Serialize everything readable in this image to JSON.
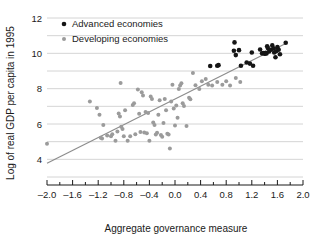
{
  "chart_data": {
    "type": "scatter",
    "title": "",
    "xlabel": "Aggregate governance measure",
    "ylabel": "Log of real GDP per capita in 1995",
    "xlim": [
      -2.0,
      2.0
    ],
    "ylim": [
      3.0,
      12.0
    ],
    "xticks": [
      -2.0,
      -1.6,
      -1.2,
      -0.8,
      -0.4,
      0.0,
      0.4,
      0.8,
      1.2,
      1.6,
      2.0
    ],
    "xtick_labels": [
      "–2.0",
      "–1.6",
      "–1.2",
      "–0.8",
      "–0.4",
      "0.0",
      "0.4",
      "0.8",
      "1.2",
      "1.6",
      "2.0"
    ],
    "xminor_step": 0.2,
    "yticks": [
      4,
      6,
      8,
      10,
      12
    ],
    "ytick_labels": [
      "4",
      "6",
      "8",
      "10",
      "12"
    ],
    "ygridlines": [
      3,
      4,
      5,
      6,
      7,
      8,
      9,
      10,
      11,
      12
    ],
    "grid": true,
    "grid_color": "#c9c9c9",
    "legend_position": "top-left",
    "legend": [
      {
        "name": "Advanced economies",
        "color": "#151515",
        "marker": "circle"
      },
      {
        "name": "Developing economies",
        "color": "#9b9b9b",
        "marker": "circle"
      }
    ],
    "trendline": {
      "name": "fitted regression line",
      "color": "#8c8c8c",
      "x": [
        -2.0,
        1.73
      ],
      "y": [
        3.78,
        10.55
      ]
    },
    "series": [
      {
        "name": "Advanced economies",
        "color": "#151515",
        "points": [
          [
            0.55,
            9.28
          ],
          [
            0.66,
            9.3
          ],
          [
            0.68,
            9.33
          ],
          [
            0.92,
            10.15
          ],
          [
            0.93,
            10.62
          ],
          [
            0.95,
            9.9
          ],
          [
            1.0,
            10.18
          ],
          [
            1.03,
            9.3
          ],
          [
            1.12,
            9.48
          ],
          [
            1.17,
            9.42
          ],
          [
            1.2,
            10.05
          ],
          [
            1.22,
            9.3
          ],
          [
            1.33,
            10.22
          ],
          [
            1.36,
            10.0
          ],
          [
            1.38,
            10.02
          ],
          [
            1.4,
            9.98
          ],
          [
            1.41,
            10.0
          ],
          [
            1.42,
            10.03
          ],
          [
            1.43,
            9.99
          ],
          [
            1.44,
            10.4
          ],
          [
            1.45,
            10.3
          ],
          [
            1.47,
            10.1
          ],
          [
            1.5,
            10.2
          ],
          [
            1.52,
            10.45
          ],
          [
            1.54,
            10.28
          ],
          [
            1.55,
            10.05
          ],
          [
            1.57,
            9.78
          ],
          [
            1.58,
            10.12
          ],
          [
            1.6,
            10.35
          ],
          [
            1.62,
            10.2
          ],
          [
            1.64,
            9.95
          ],
          [
            1.73,
            10.6
          ]
        ]
      },
      {
        "name": "Developing economies",
        "color": "#9b9b9b",
        "points": [
          [
            -2.0,
            4.88
          ],
          [
            -1.33,
            7.28
          ],
          [
            -1.22,
            6.9
          ],
          [
            -1.18,
            6.52
          ],
          [
            -1.16,
            5.22
          ],
          [
            -1.14,
            5.18
          ],
          [
            -1.12,
            5.95
          ],
          [
            -1.06,
            5.35
          ],
          [
            -1.0,
            5.3
          ],
          [
            -0.98,
            5.42
          ],
          [
            -0.93,
            5.05
          ],
          [
            -0.9,
            5.58
          ],
          [
            -0.88,
            6.6
          ],
          [
            -0.86,
            6.42
          ],
          [
            -0.85,
            8.32
          ],
          [
            -0.84,
            5.85
          ],
          [
            -0.82,
            5.72
          ],
          [
            -0.8,
            5.3
          ],
          [
            -0.78,
            6.78
          ],
          [
            -0.74,
            5.05
          ],
          [
            -0.7,
            5.3
          ],
          [
            -0.66,
            7.08
          ],
          [
            -0.64,
            7.18
          ],
          [
            -0.62,
            5.42
          ],
          [
            -0.58,
            7.95
          ],
          [
            -0.56,
            6.58
          ],
          [
            -0.54,
            5.55
          ],
          [
            -0.52,
            7.8
          ],
          [
            -0.5,
            7.62
          ],
          [
            -0.48,
            5.52
          ],
          [
            -0.46,
            6.68
          ],
          [
            -0.44,
            5.48
          ],
          [
            -0.42,
            6.62
          ],
          [
            -0.4,
            5.05
          ],
          [
            -0.38,
            7.55
          ],
          [
            -0.36,
            7.42
          ],
          [
            -0.34,
            6.08
          ],
          [
            -0.32,
            5.95
          ],
          [
            -0.3,
            5.4
          ],
          [
            -0.28,
            5.5
          ],
          [
            -0.26,
            6.52
          ],
          [
            -0.24,
            7.35
          ],
          [
            -0.22,
            5.38
          ],
          [
            -0.2,
            5.28
          ],
          [
            -0.18,
            6.05
          ],
          [
            -0.16,
            7.42
          ],
          [
            -0.14,
            6.78
          ],
          [
            -0.12,
            5.45
          ],
          [
            -0.1,
            5.4
          ],
          [
            -0.08,
            4.62
          ],
          [
            -0.06,
            7.28
          ],
          [
            -0.04,
            8.22
          ],
          [
            -0.02,
            6.88
          ],
          [
            0.0,
            5.92
          ],
          [
            0.02,
            7.05
          ],
          [
            0.04,
            6.35
          ],
          [
            0.06,
            7.98
          ],
          [
            0.08,
            8.18
          ],
          [
            0.1,
            8.3
          ],
          [
            0.12,
            7.18
          ],
          [
            0.14,
            7.02
          ],
          [
            0.18,
            5.88
          ],
          [
            0.22,
            7.48
          ],
          [
            0.24,
            7.4
          ],
          [
            0.28,
            8.88
          ],
          [
            0.32,
            8.2
          ],
          [
            0.38,
            7.98
          ],
          [
            0.42,
            8.42
          ],
          [
            0.48,
            8.55
          ],
          [
            0.52,
            8.22
          ],
          [
            0.58,
            8.18
          ],
          [
            0.66,
            8.38
          ],
          [
            0.74,
            8.22
          ],
          [
            0.8,
            8.42
          ],
          [
            0.86,
            8.18
          ],
          [
            0.95,
            8.6
          ],
          [
            1.02,
            8.38
          ]
        ]
      }
    ]
  }
}
